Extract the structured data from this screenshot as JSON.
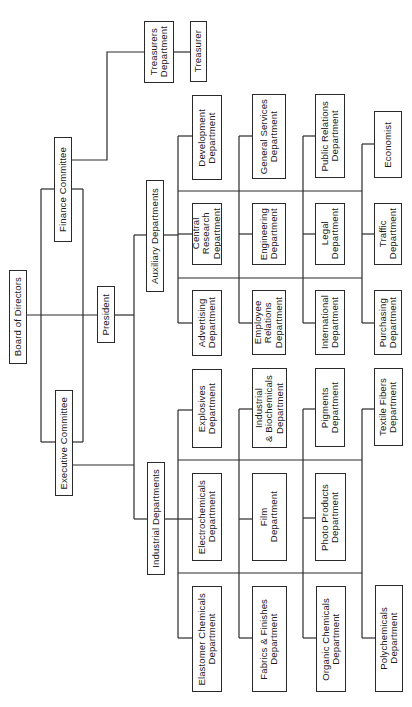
{
  "chart": {
    "orientation": "rotated 90 degrees counter-clockwise (read from bottom to top)",
    "root": "Board of Directors",
    "nodes": [
      {
        "id": "board",
        "label": "Board of Directors",
        "x": 9,
        "y": 270,
        "w": 18,
        "h": 94
      },
      {
        "id": "finance",
        "label": "Finance Committee",
        "x": 54,
        "y": 137,
        "w": 18,
        "h": 105
      },
      {
        "id": "executive",
        "label": "Executive Committee",
        "x": 55,
        "y": 390,
        "w": 18,
        "h": 106
      },
      {
        "id": "president",
        "label": "President",
        "x": 97,
        "y": 286,
        "w": 18,
        "h": 57
      },
      {
        "id": "auxiliary",
        "label": "Auxiliary Departments",
        "x": 146,
        "y": 180,
        "w": 18,
        "h": 112
      },
      {
        "id": "industrial",
        "label": "Industrial Departments",
        "x": 147,
        "y": 462,
        "w": 18,
        "h": 113
      },
      {
        "id": "treasurers",
        "label": "Treasurers\nDepartment",
        "x": 144,
        "y": 21,
        "w": 30,
        "h": 62
      },
      {
        "id": "treasurer",
        "label": "Treasurer",
        "x": 190,
        "y": 21,
        "w": 17,
        "h": 61
      },
      {
        "id": "development",
        "label": "Development\nDepartment",
        "x": 192,
        "y": 95,
        "w": 30,
        "h": 85
      },
      {
        "id": "general_services",
        "label": "General Services\nDepartment",
        "x": 252,
        "y": 94,
        "w": 34,
        "h": 85
      },
      {
        "id": "public_relations",
        "label": "Public Relations\nDepartment",
        "x": 315,
        "y": 94,
        "w": 30,
        "h": 84
      },
      {
        "id": "economist",
        "label": "Economist",
        "x": 374,
        "y": 111,
        "w": 28,
        "h": 67
      },
      {
        "id": "central_research",
        "label": "Central\nResearch\nDepartment",
        "x": 192,
        "y": 203,
        "w": 30,
        "h": 62
      },
      {
        "id": "engineering",
        "label": "Engineering\nDepartment",
        "x": 252,
        "y": 203,
        "w": 34,
        "h": 62
      },
      {
        "id": "legal",
        "label": "Legal\nDepartment",
        "x": 315,
        "y": 203,
        "w": 30,
        "h": 62
      },
      {
        "id": "traffic",
        "label": "Traffic\nDepartment",
        "x": 374,
        "y": 203,
        "w": 28,
        "h": 62
      },
      {
        "id": "advertising",
        "label": "Advertising\nDepartment",
        "x": 192,
        "y": 290,
        "w": 30,
        "h": 66
      },
      {
        "id": "employee_relations",
        "label": "Employee\nRelations\nDepartment",
        "x": 252,
        "y": 290,
        "w": 34,
        "h": 65
      },
      {
        "id": "international",
        "label": "International\nDepartment",
        "x": 315,
        "y": 290,
        "w": 30,
        "h": 65
      },
      {
        "id": "purchasing",
        "label": "Purchasing\nDepartment",
        "x": 374,
        "y": 290,
        "w": 28,
        "h": 65
      },
      {
        "id": "explosives",
        "label": "Explosives\nDepartment",
        "x": 192,
        "y": 369,
        "w": 30,
        "h": 79
      },
      {
        "id": "industrial_biochemicals",
        "label": "Industrial\n& Biochemicals\nDepartment",
        "x": 252,
        "y": 368,
        "w": 35,
        "h": 80
      },
      {
        "id": "pigments",
        "label": "Pigments\nDepartment",
        "x": 315,
        "y": 368,
        "w": 30,
        "h": 79
      },
      {
        "id": "textile_fibers",
        "label": "Textile Fibers\nDepartment",
        "x": 374,
        "y": 368,
        "w": 29,
        "h": 78
      },
      {
        "id": "electrochemicals",
        "label": "Electrochemicals\nDepartment",
        "x": 192,
        "y": 473,
        "w": 30,
        "h": 88
      },
      {
        "id": "film",
        "label": "Film\nDepartment",
        "x": 252,
        "y": 473,
        "w": 35,
        "h": 88
      },
      {
        "id": "photo_products",
        "label": "Photo Products\nDepartment",
        "x": 315,
        "y": 473,
        "w": 31,
        "h": 88
      },
      {
        "id": "elastomer_chemicals",
        "label": "Elastomer Chemicals\nDepartment",
        "x": 192,
        "y": 586,
        "w": 30,
        "h": 106
      },
      {
        "id": "fabrics_finishes",
        "label": "Fabrics & Finishes\nDepartment",
        "x": 252,
        "y": 586,
        "w": 35,
        "h": 106
      },
      {
        "id": "organic_chemicals",
        "label": "Organic Chemicals\nDepartment",
        "x": 316,
        "y": 586,
        "w": 30,
        "h": 106
      },
      {
        "id": "polychemicals",
        "label": "Polychemicals\nDepartment",
        "x": 375,
        "y": 585,
        "w": 28,
        "h": 107
      }
    ],
    "groups": {
      "auxiliary_departments": [
        "Development Department",
        "General Services Department",
        "Public Relations Department",
        "Economist",
        "Central Research Department",
        "Engineering Department",
        "Legal Department",
        "Traffic Department",
        "Advertising Department",
        "Employee Relations Department",
        "International Department",
        "Purchasing Department"
      ],
      "industrial_departments": [
        "Explosives Department",
        "Industrial & Biochemicals Department",
        "Pigments Department",
        "Textile Fibers Department",
        "Electrochemicals Department",
        "Film Department",
        "Photo Products Department",
        "Elastomer Chemicals Department",
        "Fabrics & Finishes Department",
        "Organic Chemicals Department",
        "Polychemicals Department"
      ],
      "finance_chain": [
        "Finance Committee",
        "Treasurers Department",
        "Treasurer"
      ]
    }
  }
}
